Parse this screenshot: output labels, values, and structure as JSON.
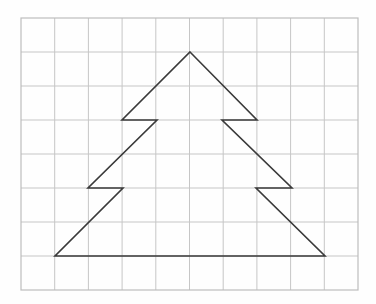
{
  "figure": {
    "background_color": "#fefefe",
    "canvas": {
      "width": 376,
      "height": 304
    }
  },
  "grid": {
    "name": "square-grid",
    "origin_x": 21,
    "origin_y": 18,
    "cell_width": 33.7,
    "cell_height": 34,
    "columns": 10,
    "rows": 8,
    "right_edge": 358,
    "bottom_edge": 290,
    "line_color": "#c6c6c6",
    "border_color": "#bdbdbd",
    "line_width": 1,
    "border_width": 1.2,
    "visible": true
  },
  "shape": {
    "name": "fir-tree-polygon",
    "type": "closed-polyline",
    "stroke_color": "#3a3a3a",
    "stroke_width": 1.6,
    "fill": "none",
    "symmetry_axis_x": 190,
    "apex": {
      "x": 190,
      "y": 52
    },
    "base_left": {
      "x": 55,
      "y": 256
    },
    "base_right": {
      "x": 325,
      "y": 256
    },
    "points": [
      {
        "label": "apex",
        "x": 190,
        "y": 52
      },
      {
        "label": "tier1-right-outer",
        "x": 257,
        "y": 120
      },
      {
        "label": "tier1-right-inner",
        "x": 222,
        "y": 120
      },
      {
        "label": "tier2-right-outer",
        "x": 292,
        "y": 188
      },
      {
        "label": "tier2-right-inner",
        "x": 256,
        "y": 188
      },
      {
        "label": "base-right",
        "x": 325,
        "y": 256
      },
      {
        "label": "base-left",
        "x": 55,
        "y": 256
      },
      {
        "label": "tier2-left-inner",
        "x": 123,
        "y": 188
      },
      {
        "label": "tier2-left-outer",
        "x": 88,
        "y": 188
      },
      {
        "label": "tier1-left-inner",
        "x": 157,
        "y": 120
      },
      {
        "label": "tier1-left-outer",
        "x": 122,
        "y": 120
      }
    ],
    "path": "M 190 52 L 257 120 L 222 120 L 292 188 L 256 188 L 325 256 L 55 256 L 123 188 L 88 188 L 157 120 L 122 120 Z"
  },
  "chart_data": {
    "type": "scatter",
    "xlabel": "",
    "ylabel": "",
    "grid": true,
    "legend": "none",
    "xlim": [
      21,
      358
    ],
    "ylim": [
      18,
      290
    ],
    "series": [
      {
        "name": "fir-tree-outline",
        "closed": true,
        "x": [
          190,
          257,
          222,
          292,
          256,
          325,
          55,
          123,
          88,
          157,
          122
        ],
        "y": [
          52,
          120,
          120,
          188,
          188,
          256,
          256,
          188,
          188,
          120,
          120
        ]
      }
    ]
  }
}
